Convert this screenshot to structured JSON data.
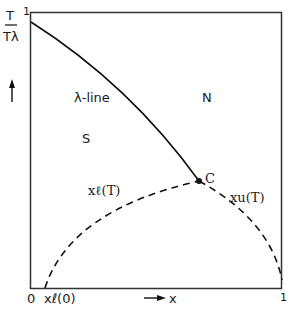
{
  "diagram": {
    "y_axis_label_num": "T",
    "y_axis_label_den": "Tλ",
    "y_axis_top_tick": "1",
    "x_axis_label": "x",
    "x_origin_tick": "0",
    "x_l0_tick": "xℓ(0)",
    "x_right_tick": "1",
    "region_superfluid": "S",
    "region_normal": "N",
    "lambda_line_label": "λ-line",
    "critical_point_label": "C",
    "lower_branch_label": "xℓ(T)",
    "upper_branch_label": "xu(T)",
    "line_color": "#1a1a1a"
  }
}
